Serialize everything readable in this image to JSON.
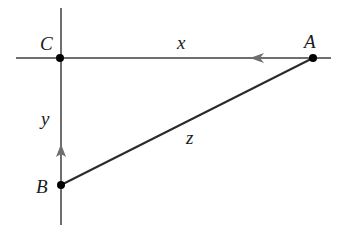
{
  "diagram": {
    "type": "right-triangle-related-rates",
    "points": {
      "C": {
        "label": "C",
        "x": 60,
        "y": 58
      },
      "A": {
        "label": "A",
        "x": 313,
        "y": 58
      },
      "B": {
        "label": "B",
        "x": 61,
        "y": 185
      }
    },
    "sides": {
      "x": {
        "label": "x",
        "from": "A",
        "to": "C",
        "arrow_direction": "left"
      },
      "y": {
        "label": "y",
        "from": "B",
        "to": "C",
        "arrow_direction": "up"
      },
      "z": {
        "label": "z",
        "from": "A",
        "to": "B"
      }
    },
    "colors": {
      "axis_line": "#6e6e6e",
      "hypotenuse": "#2a2a2a",
      "point": "#000000",
      "label": "#1a1a1a"
    }
  }
}
